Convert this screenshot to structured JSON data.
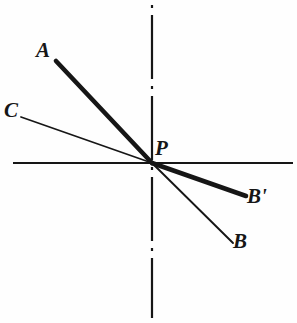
{
  "figure": {
    "kind": "geometric-line-diagram",
    "width": 297,
    "height": 323,
    "background_color": "#fefefe",
    "ink_color": "#161616"
  },
  "axes": {
    "origin": {
      "x": 152,
      "y": 163,
      "label": "P"
    },
    "horizontal": {
      "name": "horizontal-axis",
      "style": "solid",
      "x1": 13,
      "y1": 163,
      "x2": 293,
      "y2": 163,
      "stroke_width": 2.2
    },
    "vertical": {
      "name": "vertical-center-line",
      "style": "dash-dot",
      "x1": 152,
      "y1": 5,
      "x2": 152,
      "y2": 318,
      "stroke_width": 2.2,
      "dash_pattern": "2 7 62 7"
    }
  },
  "rays": [
    {
      "id": "ray-PA",
      "label": "A",
      "weight": "thick",
      "stroke_width": 4.6,
      "from": {
        "x": 152,
        "y": 163
      },
      "to": {
        "x": 56,
        "y": 61
      },
      "label_pos": {
        "x": 36,
        "y": 40
      }
    },
    {
      "id": "ray-PC",
      "label": "C",
      "weight": "thin",
      "stroke_width": 1.7,
      "from": {
        "x": 152,
        "y": 163
      },
      "to": {
        "x": 21,
        "y": 117
      },
      "label_pos": {
        "x": 4,
        "y": 100
      }
    },
    {
      "id": "ray-PBprime",
      "label": "B'",
      "weight": "thick",
      "stroke_width": 4.6,
      "from": {
        "x": 152,
        "y": 163
      },
      "to": {
        "x": 246,
        "y": 196
      },
      "label_pos": {
        "x": 247,
        "y": 186
      }
    },
    {
      "id": "ray-PB",
      "label": "B",
      "weight": "thin",
      "stroke_width": 1.9,
      "from": {
        "x": 152,
        "y": 163
      },
      "to": {
        "x": 233,
        "y": 243
      },
      "label_pos": {
        "x": 233,
        "y": 231
      }
    }
  ],
  "labels": {
    "A": "A",
    "B": "B",
    "B_prime": "B'",
    "C": "C",
    "P": "P"
  }
}
